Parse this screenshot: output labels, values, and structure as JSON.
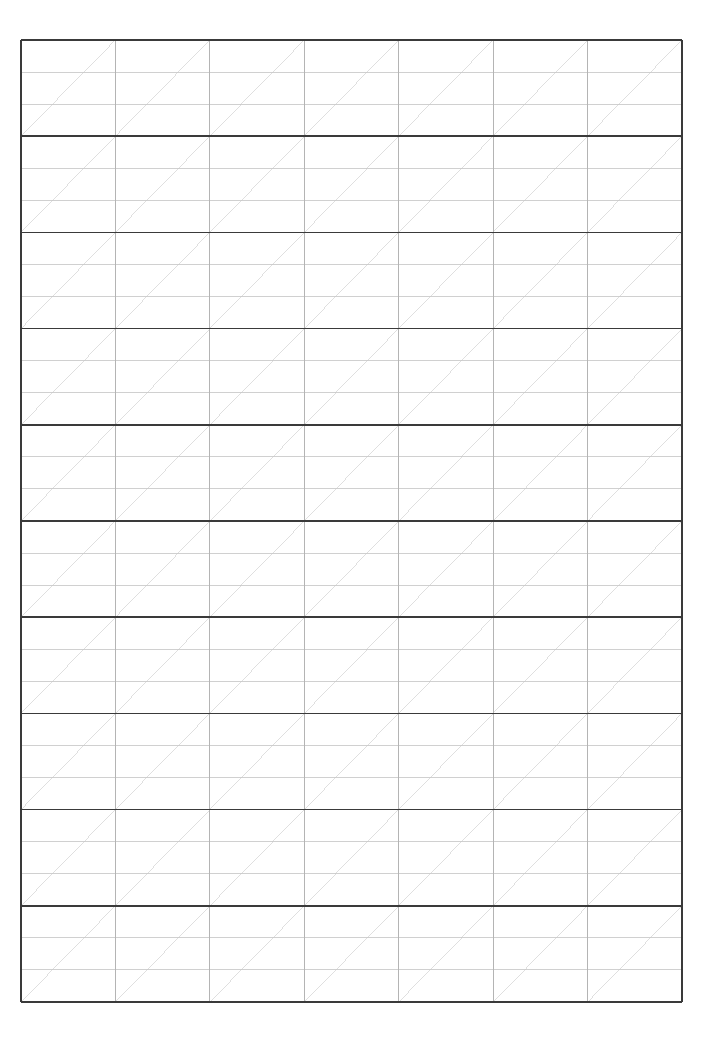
{
  "document": {
    "kind": "ruled-practice-grid-sheet",
    "title": "Practice Grid Sheet",
    "page_width": 715,
    "page_height": 1045,
    "background_color": "#ffffff",
    "orientation": "portrait",
    "visible_text": []
  },
  "grid": {
    "origin_x": 21,
    "origin_y": 40,
    "right_x": 682,
    "bottom_y": 1002,
    "total_width": 661,
    "total_height": 962,
    "columns": 7,
    "major_rows": 10,
    "sub_rows_per_major_row": 3,
    "column_width": 94.43,
    "major_row_height": 96.2,
    "sub_row_height": 32.07,
    "column_x_positions": [
      21,
      115.4,
      209.9,
      304.3,
      398.7,
      493.1,
      587.6,
      682
    ],
    "major_row_y_positions": [
      40,
      136.2,
      232.4,
      328.6,
      424.8,
      521,
      617.2,
      713.4,
      809.6,
      905.8,
      1002
    ],
    "diagonal": {
      "present": true,
      "direction": "bottom-left-to-top-right",
      "scope": "one per major cell (column x major row)",
      "count": 70
    }
  },
  "styles": {
    "major_line_color": "#3a3a3a",
    "major_line_width": 1.6,
    "column_line_color": "#b4b4b4",
    "column_line_width": 1.0,
    "sub_line_color": "#c8c8c8",
    "sub_line_width": 0.85,
    "diagonal_line_color": "#dcdcdc",
    "diagonal_line_width": 0.9,
    "outer_border_color": "#3a3a3a"
  },
  "chart_data": {
    "type": "table",
    "title": "",
    "xlabel": "",
    "ylabel": "",
    "categories": [
      "col-1",
      "col-2",
      "col-3",
      "col-4",
      "col-5",
      "col-6",
      "col-7"
    ],
    "values": [
      10,
      10,
      10,
      10,
      10,
      10,
      10
    ],
    "grid": true,
    "legend": "none",
    "note": "Blank ruled practice grid: 7 columns x 10 major rows; every major cell contains 2 light interior rules (3 sub-rows) and 1 light diagonal guide from its bottom-left to its top-right corner."
  }
}
